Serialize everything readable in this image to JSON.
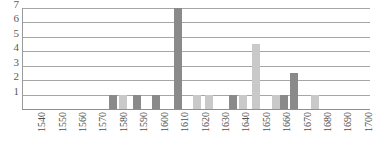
{
  "chart_data": {
    "type": "bar",
    "title": "",
    "subtitle": "",
    "xlabel": "",
    "ylabel": "",
    "grid": true,
    "legend": null,
    "ylim": [
      0,
      7
    ],
    "yticks": [
      1,
      2,
      3,
      4,
      5,
      6,
      7
    ],
    "xlim": [
      1535,
      1705
    ],
    "xticks": [
      1540,
      1550,
      1560,
      1570,
      1580,
      1590,
      1600,
      1610,
      1620,
      1630,
      1640,
      1650,
      1660,
      1670,
      1680,
      1690,
      1700
    ],
    "categories": [
      1540,
      1550,
      1560,
      1570,
      1580,
      1590,
      1600,
      1610,
      1620,
      1630,
      1640,
      1650,
      1660,
      1670,
      1680,
      1690,
      1700
    ],
    "bars": [
      {
        "x": 1579,
        "value": 1.0,
        "shade": "dark"
      },
      {
        "x": 1584,
        "value": 1.0,
        "shade": "light"
      },
      {
        "x": 1591,
        "value": 1.0,
        "shade": "dark"
      },
      {
        "x": 1600,
        "value": 1.0,
        "shade": "dark"
      },
      {
        "x": 1611,
        "value": 7.0,
        "shade": "dark"
      },
      {
        "x": 1620,
        "value": 1.0,
        "shade": "light"
      },
      {
        "x": 1626,
        "value": 1.0,
        "shade": "light"
      },
      {
        "x": 1638,
        "value": 1.0,
        "shade": "dark"
      },
      {
        "x": 1643,
        "value": 1.0,
        "shade": "light"
      },
      {
        "x": 1649,
        "value": 4.5,
        "shade": "light"
      },
      {
        "x": 1659,
        "value": 1.0,
        "shade": "light"
      },
      {
        "x": 1663,
        "value": 1.0,
        "shade": "dark"
      },
      {
        "x": 1668,
        "value": 2.5,
        "shade": "dark"
      },
      {
        "x": 1678,
        "value": 1.0,
        "shade": "light"
      }
    ],
    "colors": {
      "bar_dark": "#8a8a8a",
      "bar_light": "#c9c9c9",
      "gridline": "#a6a6a6",
      "axis": "#8f8f8f",
      "tick_label": "#4f4f4f",
      "background": "#ffffff"
    }
  }
}
